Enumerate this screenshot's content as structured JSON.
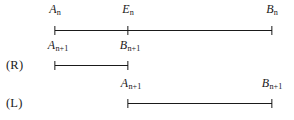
{
  "figure": {
    "type": "interval-bisection-diagram",
    "width": 294,
    "height": 120,
    "background": "#ffffff",
    "ink": "#1a1a1a"
  },
  "rows": [
    {
      "case_label": "",
      "line_y": 30,
      "label_y": 3,
      "x_start": 55,
      "x_end": 272,
      "ticks": [
        {
          "x": 55,
          "label_main": "A",
          "label_sub": "n",
          "label_x": 55
        },
        {
          "x": 128,
          "label_main": "E",
          "label_sub": "n",
          "label_x": 128
        },
        {
          "x": 272,
          "label_main": "B",
          "label_sub": "n",
          "label_x": 272
        }
      ]
    },
    {
      "case_label": "(R)",
      "case_label_x": 6,
      "case_label_y": 58,
      "line_y": 65,
      "label_y": 39,
      "x_start": 55,
      "x_end": 128,
      "ticks": [
        {
          "x": 55,
          "label_main": "A",
          "label_sub": "n+1",
          "label_x": 58
        },
        {
          "x": 128,
          "label_main": "B",
          "label_sub": "n+1",
          "label_x": 130
        }
      ]
    },
    {
      "case_label": "(L)",
      "case_label_x": 6,
      "case_label_y": 96,
      "line_y": 103,
      "label_y": 77,
      "x_start": 128,
      "x_end": 272,
      "ticks": [
        {
          "x": 128,
          "label_main": "A",
          "label_sub": "n+1",
          "label_x": 131
        },
        {
          "x": 272,
          "label_main": "B",
          "label_sub": "n+1",
          "label_x": 272
        }
      ]
    }
  ],
  "text_inventory": {
    "row1_labels": [
      "A_n",
      "E_n",
      "B_n"
    ],
    "row2_case": "(R)",
    "row2_labels": [
      "A_n+1",
      "B_n+1"
    ],
    "row3_case": "(L)",
    "row3_labels": [
      "A_n+1",
      "B_n+1"
    ]
  }
}
